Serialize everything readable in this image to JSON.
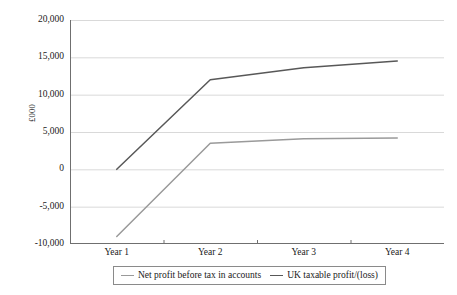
{
  "chart_data": {
    "type": "line",
    "title": "",
    "xlabel": "",
    "ylabel": "£000",
    "categories": [
      "Year 1",
      "Year 2",
      "Year 3",
      "Year 4"
    ],
    "ylim": [
      -10000,
      20000
    ],
    "ytick_step": 5000,
    "ytick_labels": [
      "20,000",
      "15,000",
      "10,000",
      "5,000",
      "0",
      "-5,000",
      "-10,000"
    ],
    "ytick_values": [
      20000,
      15000,
      10000,
      5000,
      0,
      -5000,
      -10000
    ],
    "grid": "horizontal",
    "legend_position": "bottom",
    "series": [
      {
        "name": "Net profit before tax in accounts",
        "color": "#9a9a9a",
        "values": [
          -9000,
          3500,
          4100,
          4200
        ]
      },
      {
        "name": "UK taxable profit/(loss)",
        "color": "#585858",
        "values": [
          0,
          12000,
          13600,
          14500
        ]
      }
    ]
  },
  "axes": {
    "y_title": "£000",
    "y_ticks": [
      "20,000",
      "15,000",
      "10,000",
      "5,000",
      "0",
      "-5,000",
      "-10,000"
    ],
    "x_ticks": [
      "Year 1",
      "Year 2",
      "Year 3",
      "Year 4"
    ]
  },
  "legend": {
    "items": [
      {
        "label": "Net profit before tax in accounts",
        "color": "#9a9a9a"
      },
      {
        "label": "UK taxable profit/(loss)",
        "color": "#585858"
      }
    ]
  },
  "colors": {
    "gridline": "#d9d9d9",
    "axis": "#6f6f6f",
    "series_light": "#9a9a9a",
    "series_dark": "#585858",
    "legend_border": "#8a8a8a",
    "text": "#1a1a1a",
    "background": "#ffffff"
  }
}
